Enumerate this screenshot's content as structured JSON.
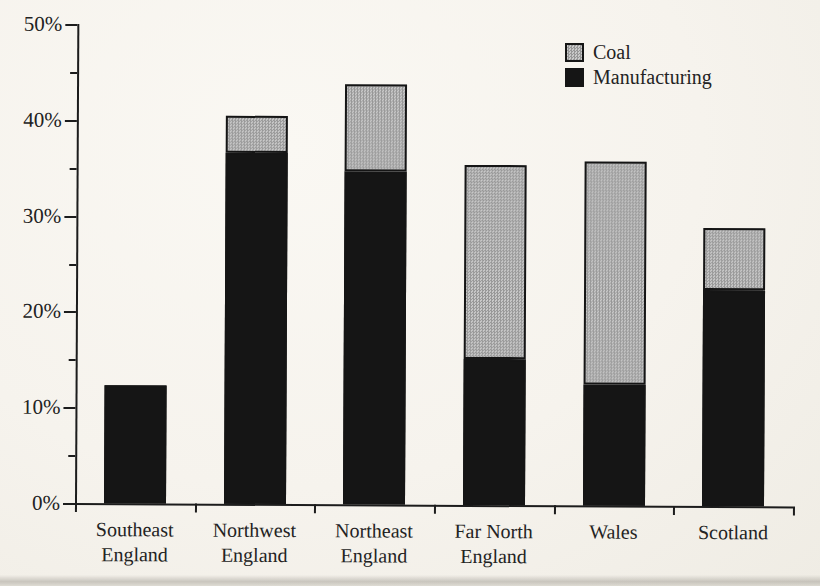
{
  "page": {
    "background_color": "#f6f3ed",
    "text_color": "#232323"
  },
  "chart_data": {
    "type": "bar",
    "stacked": true,
    "title": "",
    "xlabel": "",
    "ylabel": "",
    "categories": [
      "Southeast England",
      "Northwest England",
      "Northeast England",
      "Far North England",
      "Wales",
      "Scotland"
    ],
    "category_label_lines": [
      [
        "Southeast",
        "England"
      ],
      [
        "Northwest",
        "England"
      ],
      [
        "Northeast",
        "England"
      ],
      [
        "Far North",
        "England"
      ],
      [
        "Wales"
      ],
      [
        "Scotland"
      ]
    ],
    "series": [
      {
        "name": "Manufacturing",
        "color": "#151515",
        "pattern": "solid",
        "values": [
          12.3,
          36.6,
          34.8,
          15.2,
          12.6,
          22.5
        ]
      },
      {
        "name": "Coal",
        "color": "#ababab",
        "pattern": "halftone-checker",
        "pattern_colors": [
          "#979797",
          "#c9c9c9"
        ],
        "values": [
          0,
          3.9,
          9.0,
          20.3,
          23.3,
          6.5
        ]
      }
    ],
    "totals": [
      12.3,
      40.5,
      43.8,
      35.5,
      35.9,
      29.0
    ],
    "y_axis": {
      "min": 0,
      "max": 50,
      "major_tick_step": 10,
      "minor_tick_step": 5,
      "tick_labels": [
        "0%",
        "10%",
        "20%",
        "30%",
        "40%",
        "50%"
      ],
      "grid": false
    },
    "legend": {
      "position": "top-right",
      "items": [
        "Coal",
        "Manufacturing"
      ]
    }
  }
}
